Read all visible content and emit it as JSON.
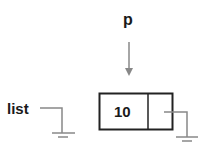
{
  "diagram": {
    "type": "linked-list-node",
    "pointer_p": {
      "label": "p"
    },
    "pointer_list": {
      "label": "list",
      "target": "null"
    },
    "node": {
      "data": "10",
      "next": "null"
    },
    "colors": {
      "box": "#222222",
      "line": "#888888",
      "text": "#1a1a1a",
      "background": "#ffffff"
    }
  }
}
